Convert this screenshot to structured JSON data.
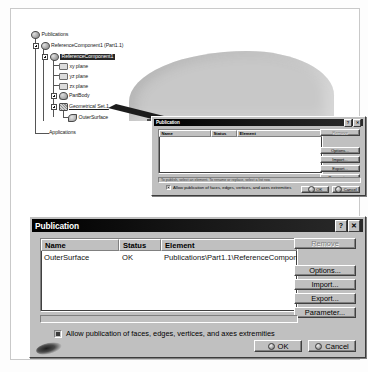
{
  "app": {
    "title": "CATIA Publication workflow screenshot"
  },
  "tree": {
    "name": "specification-tree",
    "nodes": [
      {
        "label": "Publications",
        "icon": "globe-icon",
        "state": "normal"
      },
      {
        "label": "ReferenceComponent1 (Part1.1)",
        "icon": "globe-icon",
        "state": "normal"
      },
      {
        "label": "ReferenceComponent1",
        "icon": "globe-icon",
        "state": "selected"
      },
      {
        "label": "xy plane",
        "icon": "plane-icon",
        "state": "normal"
      },
      {
        "label": "yz plane",
        "icon": "plane-icon",
        "state": "normal"
      },
      {
        "label": "zx plane",
        "icon": "plane-icon",
        "state": "normal"
      },
      {
        "label": "PartBody",
        "icon": "body-icon",
        "state": "normal"
      },
      {
        "label": "Geometrical Set.1",
        "icon": "geometrical-set-icon",
        "state": "underlined"
      },
      {
        "label": "OuterSurface",
        "icon": "surface-icon",
        "state": "normal"
      },
      {
        "label": "Applications",
        "icon": "none",
        "state": "normal"
      }
    ],
    "expanders": [
      "+",
      "+",
      "+",
      "+",
      "+"
    ]
  },
  "viewport": {
    "model_name": "outer-surface-model"
  },
  "dialog_small": {
    "title": "Publication",
    "titlebar_buttons": [
      {
        "name": "help-button",
        "glyph": "?"
      },
      {
        "name": "close-button",
        "glyph": "✕"
      }
    ],
    "columns": [
      "Name",
      "Status",
      "Element"
    ],
    "rows": [],
    "side_buttons": [
      {
        "label": "Remove",
        "enabled": false
      },
      {
        "label": "Options...",
        "enabled": true
      },
      {
        "label": "Import...",
        "enabled": true
      },
      {
        "label": "Export...",
        "enabled": true
      },
      {
        "label": "Parameter...",
        "enabled": true
      }
    ],
    "status_text": "To publish, select an element. To rename or replace, select a list row.",
    "checkbox": {
      "label": "Allow publication of faces, edges, vertices, and axes extremities",
      "checked": true
    },
    "footer_buttons": [
      {
        "label": "OK"
      },
      {
        "label": "Cancel"
      }
    ]
  },
  "dialog_large": {
    "title": "Publication",
    "titlebar_buttons": [
      {
        "name": "help-button",
        "glyph": "?"
      },
      {
        "name": "close-button",
        "glyph": "✕"
      }
    ],
    "columns": [
      "Name",
      "Status",
      "Element"
    ],
    "rows": [
      {
        "name": "OuterSurface",
        "status": "OK",
        "element": "Publications\\Part1.1\\ReferenceComponent1\\..."
      }
    ],
    "side_buttons": [
      {
        "label": "Remove",
        "enabled": false
      },
      {
        "label": "Options...",
        "enabled": true
      },
      {
        "label": "Import...",
        "enabled": true
      },
      {
        "label": "Export...",
        "enabled": true
      },
      {
        "label": "Parameter...",
        "enabled": true
      }
    ],
    "checkbox": {
      "label": "Allow publication of faces, edges, vertices, and axes extremities",
      "checked": true
    },
    "footer_buttons": [
      {
        "label": "OK"
      },
      {
        "label": "Cancel"
      }
    ]
  },
  "colors": {
    "dialog_face": "#c0c0c0",
    "titlebar": "#000000",
    "model_gray": "#c8c8c8",
    "selection": "#262626"
  }
}
